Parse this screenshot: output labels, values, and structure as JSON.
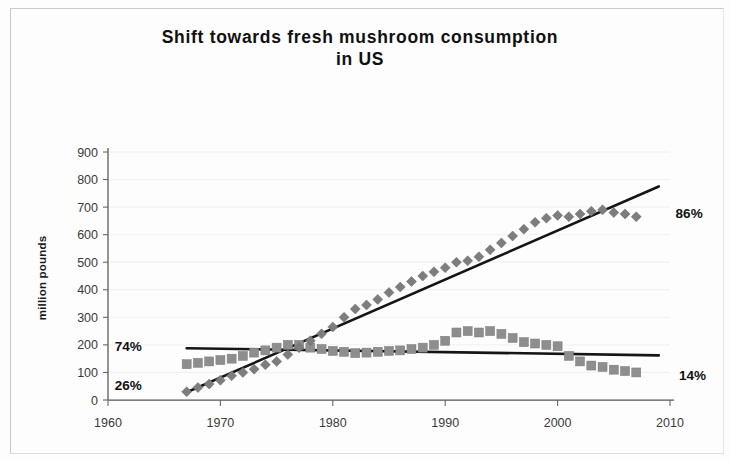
{
  "chart_data": {
    "type": "scatter",
    "title": "Shift towards fresh mushroom consumption in US",
    "title_line1": "Shift towards fresh mushroom consumption",
    "title_line2": "in US",
    "xlabel": "",
    "ylabel": "million pounds",
    "xlim": [
      1960,
      2010
    ],
    "ylim": [
      0,
      900
    ],
    "xticks": [
      1960,
      1970,
      1980,
      1990,
      2000,
      2010
    ],
    "yticks": [
      0,
      100,
      200,
      300,
      400,
      500,
      600,
      700,
      800,
      900
    ],
    "grid": false,
    "legend": "none",
    "series": [
      {
        "name": "fresh",
        "marker": "diamond",
        "color": "#7d7d7d",
        "x": [
          1967,
          1968,
          1969,
          1970,
          1971,
          1972,
          1973,
          1974,
          1975,
          1976,
          1977,
          1978,
          1979,
          1980,
          1981,
          1982,
          1983,
          1984,
          1985,
          1986,
          1987,
          1988,
          1989,
          1990,
          1991,
          1992,
          1993,
          1994,
          1995,
          1996,
          1997,
          1998,
          1999,
          2000,
          2001,
          2002,
          2003,
          2004,
          2005,
          2006,
          2007
        ],
        "values": [
          30,
          45,
          58,
          72,
          88,
          100,
          112,
          128,
          140,
          165,
          190,
          215,
          240,
          265,
          300,
          330,
          345,
          365,
          390,
          410,
          430,
          450,
          465,
          480,
          500,
          505,
          520,
          545,
          570,
          595,
          620,
          645,
          660,
          670,
          665,
          675,
          685,
          690,
          680,
          675,
          665
        ]
      },
      {
        "name": "processed",
        "marker": "square",
        "color": "#8e8e8e",
        "x": [
          1967,
          1968,
          1969,
          1970,
          1971,
          1972,
          1973,
          1974,
          1975,
          1976,
          1977,
          1978,
          1979,
          1980,
          1981,
          1982,
          1983,
          1984,
          1985,
          1986,
          1987,
          1988,
          1989,
          1990,
          1991,
          1992,
          1993,
          1994,
          1995,
          1996,
          1997,
          1998,
          1999,
          2000,
          2001,
          2002,
          2003,
          2004,
          2005,
          2006,
          2007
        ],
        "values": [
          130,
          135,
          140,
          145,
          150,
          160,
          172,
          180,
          190,
          200,
          200,
          190,
          185,
          178,
          175,
          170,
          172,
          175,
          178,
          180,
          185,
          190,
          200,
          215,
          245,
          250,
          245,
          250,
          240,
          225,
          210,
          205,
          200,
          195,
          160,
          140,
          125,
          120,
          110,
          105,
          100
        ]
      }
    ],
    "trendlines": [
      {
        "name": "fresh-trend",
        "x": [
          1967,
          2009
        ],
        "y": [
          28,
          775
        ],
        "color": "#151515"
      },
      {
        "name": "processed-trend",
        "x": [
          1967,
          2009
        ],
        "y": [
          188,
          162
        ],
        "color": "#151515"
      }
    ],
    "annotations": [
      {
        "name": "pct-74",
        "text": "74%",
        "x": 1960.6,
        "y": 195,
        "anchor": "start"
      },
      {
        "name": "pct-26",
        "text": "26%",
        "x": 1960.6,
        "y": 55,
        "anchor": "start"
      },
      {
        "name": "pct-86",
        "text": "86%",
        "x": 2010.5,
        "y": 680,
        "anchor": "start"
      },
      {
        "name": "pct-14",
        "text": "14%",
        "x": 2010.8,
        "y": 92,
        "anchor": "start"
      }
    ]
  }
}
